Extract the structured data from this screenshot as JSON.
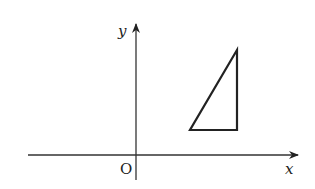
{
  "diagram": {
    "type": "coordinate-plane",
    "axes": {
      "x_label": "x",
      "y_label": "y",
      "origin_label": "O"
    },
    "shapes": [
      {
        "type": "right-triangle",
        "description": "Right triangle in first quadrant with vertical leg on right and horizontal base"
      }
    ],
    "colors": {
      "stroke": "#222222",
      "background": "#ffffff"
    }
  }
}
